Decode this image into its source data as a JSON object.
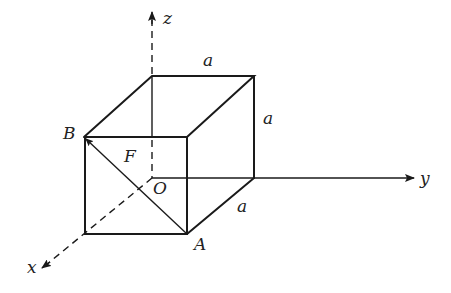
{
  "diagram": {
    "type": "3d-cube-coordinate-system",
    "axes": {
      "x": {
        "label": "x"
      },
      "y": {
        "label": "y"
      },
      "z": {
        "label": "z"
      }
    },
    "points": {
      "origin": {
        "label": "O"
      },
      "A": {
        "label": "A"
      },
      "B": {
        "label": "B"
      },
      "F": {
        "label": "F"
      }
    },
    "edge_labels": {
      "top": "a",
      "right": "a",
      "bottom": "a"
    },
    "colors": {
      "line": "#1a1a1a",
      "background": "#ffffff"
    }
  }
}
